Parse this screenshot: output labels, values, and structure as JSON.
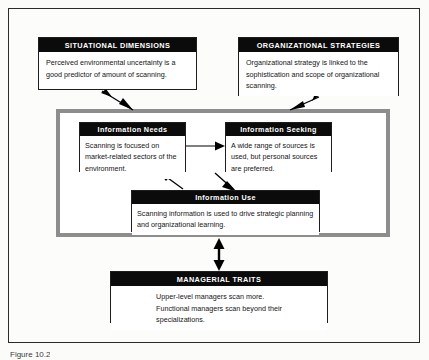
{
  "figure": {
    "caption": "Figure 10.2",
    "diagram_type": "block-flow-diagram",
    "colors": {
      "page_background": "#fbfbfa",
      "frame_border": "#2a2a2a",
      "node_title_background": "#0b0b0b",
      "node_title_text": "#ffffff",
      "node_body_text": "#151515",
      "container_border": "#8d8d8d",
      "arrow": "#000000"
    }
  },
  "nodes": {
    "situational": {
      "title": "SITUATIONAL DIMENSIONS",
      "body": "Perceived environmental uncertainty is a good predictor of amount of scanning."
    },
    "organizational": {
      "title": "ORGANIZATIONAL STRATEGIES",
      "body": "Organizational strategy is linked to the sophistication and scope of organizational scanning."
    },
    "needs": {
      "title": "Information Needs",
      "body": "Scanning is focused on market-related sectors of the environment."
    },
    "seeking": {
      "title": "Information Seeking",
      "body": "A wide range of sources is used, but personal sources are preferred."
    },
    "use": {
      "title": "Information Use",
      "body": "Scanning information is used to drive strategic planning and organizational learning."
    },
    "traits": {
      "title": "MANAGERIAL TRAITS",
      "body_line_1": "Upper-level managers scan more.",
      "body_line_2": "Functional managers scan beyond their",
      "body_line_3": "specializations."
    }
  },
  "arrows": [
    {
      "name": "situational-to-scanning",
      "style": "diagonal-single",
      "direction": "down-right"
    },
    {
      "name": "organizational-to-scanning",
      "style": "diagonal-single",
      "direction": "down-left"
    },
    {
      "name": "needs-to-seeking",
      "style": "horizontal-single",
      "direction": "right"
    },
    {
      "name": "use-to-needs",
      "style": "diagonal-single",
      "direction": "up-left"
    },
    {
      "name": "seeking-to-use",
      "style": "diagonal-single",
      "direction": "down-right"
    },
    {
      "name": "traits-to-scanning",
      "style": "vertical-double",
      "direction": "both"
    }
  ]
}
